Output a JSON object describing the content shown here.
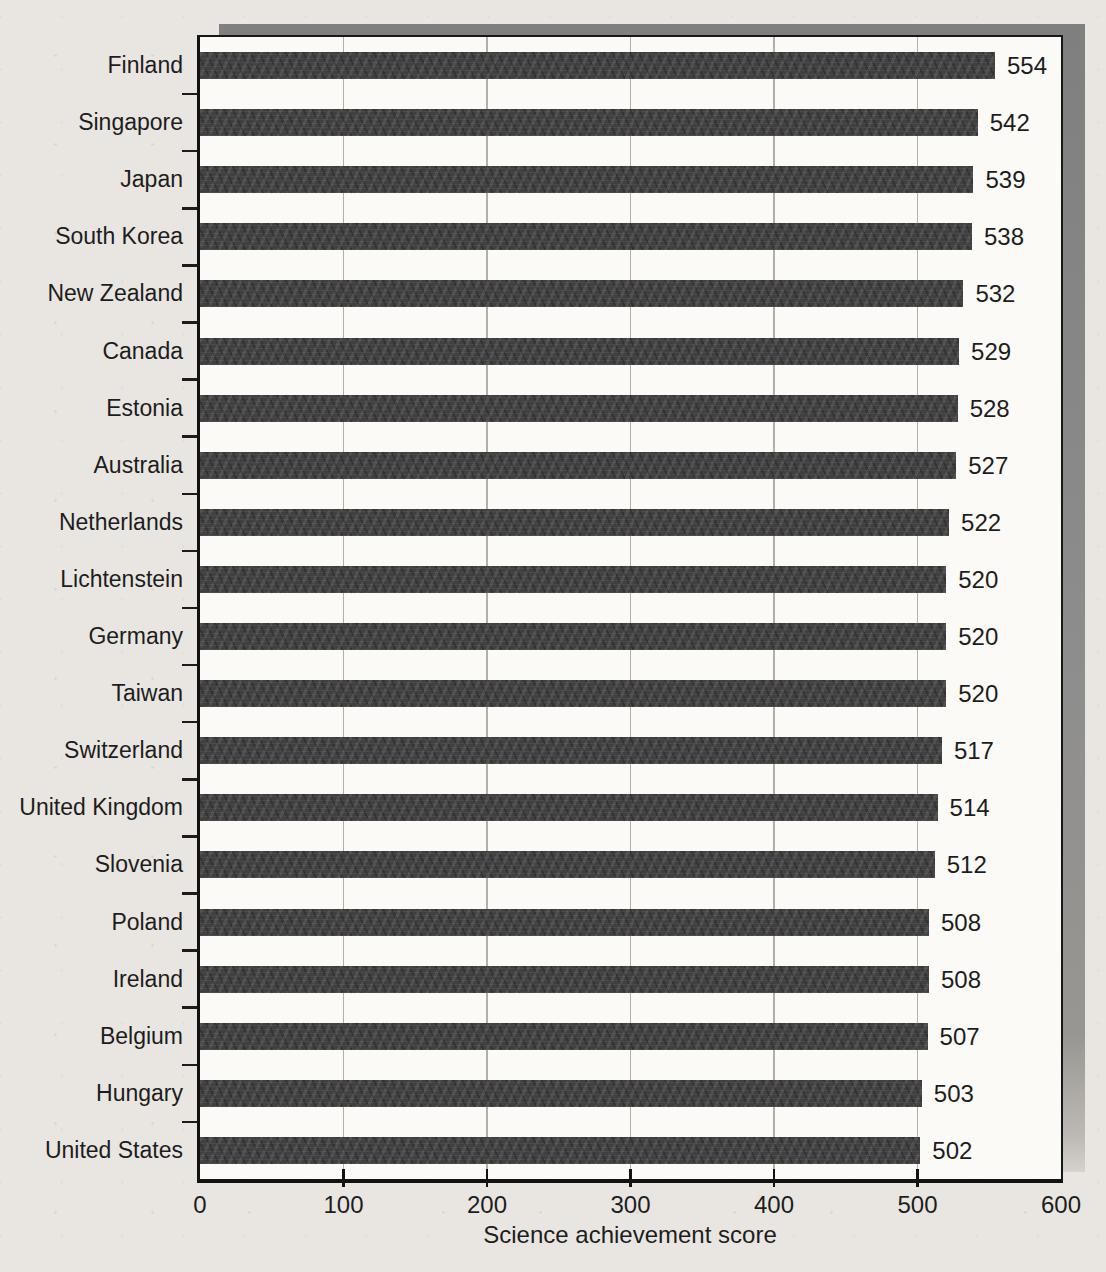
{
  "chart_data": {
    "type": "bar",
    "orientation": "horizontal",
    "title": "",
    "xlabel": "Science achievement score",
    "ylabel": "",
    "categories": [
      "Finland",
      "Singapore",
      "Japan",
      "South Korea",
      "New Zealand",
      "Canada",
      "Estonia",
      "Australia",
      "Netherlands",
      "Lichtenstein",
      "Germany",
      "Taiwan",
      "Switzerland",
      "United Kingdom",
      "Slovenia",
      "Poland",
      "Ireland",
      "Belgium",
      "Hungary",
      "United States"
    ],
    "values": [
      554,
      542,
      539,
      538,
      532,
      529,
      528,
      527,
      522,
      520,
      520,
      520,
      517,
      514,
      512,
      508,
      508,
      507,
      503,
      502
    ],
    "xlim": [
      0,
      600
    ],
    "xticks": [
      0,
      100,
      200,
      300,
      400,
      500,
      600
    ],
    "grid": "vertical-major-only",
    "legend": "none",
    "value_labels": "right-of-bar",
    "colors": {
      "bar": "#404040",
      "plot_background": "#fbfaf7",
      "page_background": "#e9e6e1",
      "shadow": "#8d8d8d",
      "gridline": "#b2afa9",
      "border": "#131313",
      "text": "#1d1d1d"
    }
  }
}
